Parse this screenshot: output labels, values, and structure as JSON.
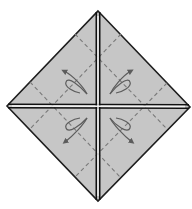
{
  "diagram": {
    "type": "origami-fold-diagram",
    "colors": {
      "background": "#ffffff",
      "paper_fill": "#c6c6c6",
      "outline": "#1e1e1e",
      "cut_line": "#111111",
      "cut_gap": "#f2f2f2",
      "dashed_fold": "#7a7a7a",
      "arrow": "#5c5c5c"
    },
    "shape": {
      "top": [
        98,
        11
      ],
      "right": [
        190,
        107
      ],
      "bottom": [
        98,
        201
      ],
      "left": [
        7,
        106
      ],
      "center": [
        98,
        106
      ]
    },
    "fold_lines": [
      {
        "id": "fold-a",
        "from": [
          30,
          82
        ],
        "to": [
          121,
          178
        ],
        "style": "dashed"
      },
      {
        "id": "fold-b",
        "from": [
          75,
          34
        ],
        "to": [
          167,
          129
        ],
        "style": "dashed"
      },
      {
        "id": "fold-c",
        "from": [
          121,
          34
        ],
        "to": [
          30,
          129
        ],
        "style": "dashed"
      },
      {
        "id": "fold-d",
        "from": [
          167,
          83
        ],
        "to": [
          75,
          177
        ],
        "style": "dashed"
      }
    ],
    "arrows": [
      {
        "id": "arrow-upper-left",
        "quadrant": "upper-left",
        "direction": "up-left"
      },
      {
        "id": "arrow-upper-right",
        "quadrant": "upper-right",
        "direction": "up-right"
      },
      {
        "id": "arrow-lower-left",
        "quadrant": "lower-left",
        "direction": "down-left"
      },
      {
        "id": "arrow-lower-right",
        "quadrant": "lower-right",
        "direction": "down-right"
      }
    ]
  }
}
